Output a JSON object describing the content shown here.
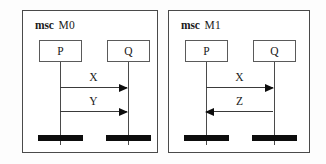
{
  "diagram": {
    "type": "message-sequence-chart",
    "panels": [
      {
        "keyword": "msc",
        "name": "M0",
        "instances": [
          {
            "label": "P"
          },
          {
            "label": "Q"
          }
        ],
        "messages": [
          {
            "label": "X",
            "from": "P",
            "to": "Q",
            "direction": "right"
          },
          {
            "label": "Y",
            "from": "P",
            "to": "Q",
            "direction": "right"
          }
        ]
      },
      {
        "keyword": "msc",
        "name": "M1",
        "instances": [
          {
            "label": "P"
          },
          {
            "label": "Q"
          }
        ],
        "messages": [
          {
            "label": "X",
            "from": "P",
            "to": "Q",
            "direction": "right"
          },
          {
            "label": "Z",
            "from": "Q",
            "to": "P",
            "direction": "left"
          }
        ]
      }
    ],
    "colors": {
      "border": "#4a4a4a",
      "line": "#3a3a3a",
      "terminator": "#0d0d0d",
      "text": "#1a1a1a",
      "background": "#ffffff"
    }
  }
}
